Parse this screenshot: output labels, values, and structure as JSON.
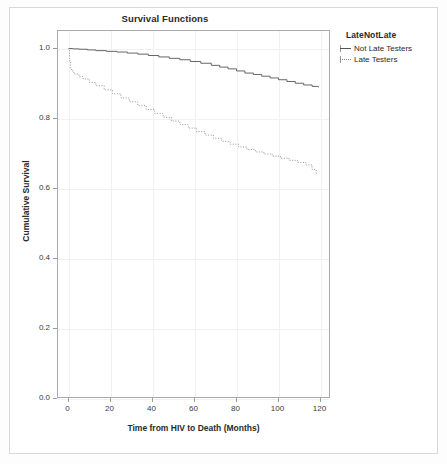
{
  "chart_data": {
    "type": "line",
    "title": "Survival Functions",
    "xlabel": "Time from HIV to Death (Months)",
    "ylabel": "Cumulative Survival",
    "xlim": [
      -5,
      125
    ],
    "ylim": [
      0.0,
      1.05
    ],
    "xticks": [
      0,
      20,
      40,
      60,
      80,
      100,
      120
    ],
    "yticks": [
      0.0,
      0.2,
      0.4,
      0.6,
      0.8,
      1.0
    ],
    "xtick_labels": [
      "0",
      "20",
      "40",
      "60",
      "80",
      "100",
      "120"
    ],
    "ytick_labels": [
      "0.0",
      "0.2",
      "0.4",
      "0.6",
      "0.8",
      "1.0"
    ],
    "grid": true,
    "legend": {
      "title": "LateNotLate",
      "position": "top-right-outside",
      "entries": [
        {
          "label": "Not Late Testers",
          "style": "solid",
          "color": "#555555"
        },
        {
          "label": "Late Testers",
          "style": "dotted",
          "color": "#8a8a8a"
        }
      ]
    },
    "series": [
      {
        "name": "Not Late Testers",
        "style": "solid",
        "color": "#555555",
        "x": [
          0,
          2,
          5,
          9,
          13,
          18,
          23,
          28,
          33,
          38,
          43,
          48,
          53,
          58,
          63,
          68,
          72,
          76,
          80,
          84,
          88,
          92,
          96,
          100,
          104,
          108,
          112,
          116,
          119
        ],
        "y": [
          1.0,
          0.999,
          0.998,
          0.996,
          0.994,
          0.992,
          0.99,
          0.987,
          0.984,
          0.98,
          0.976,
          0.972,
          0.968,
          0.963,
          0.958,
          0.952,
          0.947,
          0.942,
          0.936,
          0.93,
          0.926,
          0.921,
          0.916,
          0.911,
          0.906,
          0.901,
          0.896,
          0.892,
          0.889
        ]
      },
      {
        "name": "Late Testers",
        "style": "dotted",
        "color": "#8a8a8a",
        "x": [
          0,
          0.5,
          1,
          2,
          3,
          5,
          7,
          10,
          13,
          17,
          21,
          25,
          29,
          33,
          37,
          41,
          45,
          49,
          53,
          57,
          61,
          65,
          69,
          73,
          77,
          81,
          85,
          89,
          93,
          97,
          101,
          105,
          109,
          113,
          116,
          118
        ],
        "y": [
          1.0,
          0.965,
          0.94,
          0.932,
          0.927,
          0.92,
          0.913,
          0.903,
          0.894,
          0.882,
          0.871,
          0.859,
          0.848,
          0.837,
          0.826,
          0.815,
          0.804,
          0.793,
          0.783,
          0.773,
          0.763,
          0.753,
          0.744,
          0.735,
          0.727,
          0.719,
          0.712,
          0.705,
          0.699,
          0.693,
          0.687,
          0.681,
          0.675,
          0.668,
          0.655,
          0.641
        ]
      }
    ]
  }
}
